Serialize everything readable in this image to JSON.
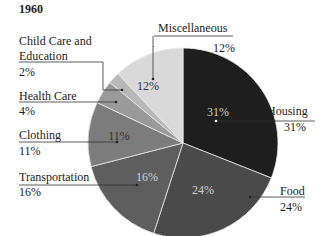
{
  "chart_data": {
    "type": "pie",
    "title": "1960",
    "categories": [
      "Housing",
      "Food",
      "Transportation",
      "Clothing",
      "Health Care",
      "Child Care and Education",
      "Miscellaneous"
    ],
    "values": [
      31,
      24,
      16,
      11,
      4,
      2,
      12
    ],
    "unit": "%",
    "colors": [
      "#1e1e1e",
      "#4a4a4a",
      "#5e5e5e",
      "#7c7c7c",
      "#9a9a9a",
      "#b8b8b8",
      "#d9d9d9"
    ],
    "inner_labels": [
      "31%",
      "24%",
      "16%",
      "11%",
      "",
      "",
      "12%"
    ],
    "legend": "callout labels with leader lines"
  },
  "labels": {
    "title": "1960",
    "housing": {
      "name": "Housing",
      "value": "31%"
    },
    "food": {
      "name": "Food",
      "value": "24%"
    },
    "transportation": {
      "name": "Transportation",
      "value": "16%"
    },
    "clothing": {
      "name": "Clothing",
      "value": "11%"
    },
    "health": {
      "name": "Health Care",
      "value": "4%"
    },
    "childcare": {
      "name1": "Child Care and",
      "name2": "Education",
      "value": "2%"
    },
    "misc": {
      "name": "Miscellaneous",
      "value": "12%"
    }
  }
}
